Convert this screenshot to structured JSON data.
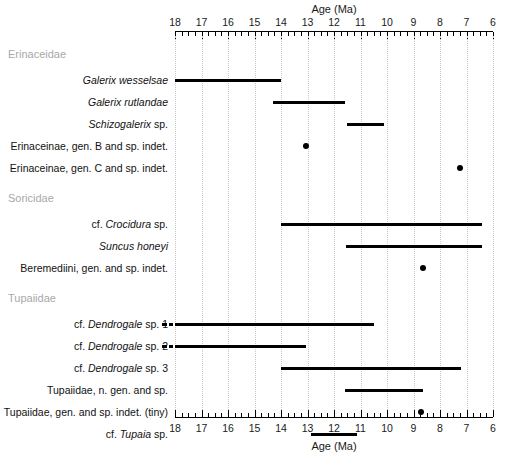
{
  "chart_data": {
    "type": "bar",
    "orientation": "horizontal",
    "title": "",
    "xlabel": "Age (Ma)",
    "ylabel": "",
    "xlim": [
      18,
      6
    ],
    "x_axis_reversed": true,
    "x_ticks": [
      18,
      17,
      16,
      15,
      14,
      13,
      12,
      11,
      10,
      9,
      8,
      7,
      6
    ],
    "x_minor_tick_interval": 0.25,
    "axes_shown": [
      "top",
      "bottom"
    ],
    "grid": "vertical dotted gridlines at every whole Ma",
    "legend": "none",
    "units": "Ma (millions of years ago)",
    "groups": [
      {
        "name": "Erinaceidae",
        "taxa": [
          {
            "label_parts": [
              {
                "text": "Galerix wesselsae",
                "style": "italic"
              }
            ],
            "label_plain": "Galerix wesselsae",
            "kind": "range",
            "start_ma": 18.0,
            "end_ma": 14.0,
            "dashed_extension": false
          },
          {
            "label_parts": [
              {
                "text": "Galerix rutlandae",
                "style": "italic"
              }
            ],
            "label_plain": "Galerix rutlandae",
            "kind": "range",
            "start_ma": 14.3,
            "end_ma": 11.6,
            "dashed_extension": false
          },
          {
            "label_parts": [
              {
                "text": "Schizogalerix",
                "style": "italic"
              },
              {
                "text": " sp.",
                "style": "normal"
              }
            ],
            "label_plain": "Schizogalerix sp.",
            "kind": "range",
            "start_ma": 11.5,
            "end_ma": 10.1,
            "dashed_extension": false
          },
          {
            "label_parts": [
              {
                "text": "Erinaceinae, gen. B and sp. indet.",
                "style": "normal"
              }
            ],
            "label_plain": "Erinaceinae, gen. B and sp. indet.",
            "kind": "point",
            "at_ma": 13.05,
            "dashed_extension": false
          },
          {
            "label_parts": [
              {
                "text": "Erinaceinae, gen. C and sp. indet.",
                "style": "normal"
              }
            ],
            "label_plain": "Erinaceinae, gen. C and sp. indet.",
            "kind": "point",
            "at_ma": 7.25,
            "dashed_extension": false
          }
        ]
      },
      {
        "name": "Soricidae",
        "taxa": [
          {
            "label_parts": [
              {
                "text": "cf. ",
                "style": "normal"
              },
              {
                "text": "Crocidura",
                "style": "italic"
              },
              {
                "text": " sp.",
                "style": "normal"
              }
            ],
            "label_plain": "cf. Crocidura sp.",
            "kind": "range",
            "start_ma": 14.0,
            "end_ma": 6.4,
            "dashed_extension": false
          },
          {
            "label_parts": [
              {
                "text": "Suncus honeyi",
                "style": "italic"
              }
            ],
            "label_plain": "Suncus honeyi",
            "kind": "range",
            "start_ma": 11.55,
            "end_ma": 6.4,
            "dashed_extension": false
          },
          {
            "label_parts": [
              {
                "text": "Beremediini, gen. and sp. indet.",
                "style": "normal"
              }
            ],
            "label_plain": "Beremediini, gen. and sp. indet.",
            "kind": "point",
            "at_ma": 8.65,
            "dashed_extension": false
          }
        ]
      },
      {
        "name": "Tupaiidae",
        "taxa": [
          {
            "label_parts": [
              {
                "text": "cf. ",
                "style": "normal"
              },
              {
                "text": "Dendrogale",
                "style": "italic"
              },
              {
                "text": " sp. 1",
                "style": "normal"
              }
            ],
            "label_plain": "cf. Dendrogale sp. 1",
            "kind": "range",
            "start_ma": 18.0,
            "end_ma": 10.5,
            "dashed_extension": true
          },
          {
            "label_parts": [
              {
                "text": "cf. ",
                "style": "normal"
              },
              {
                "text": "Dendrogale",
                "style": "italic"
              },
              {
                "text": " sp. 2",
                "style": "normal"
              }
            ],
            "label_plain": "cf. Dendrogale sp. 2",
            "kind": "range",
            "start_ma": 18.0,
            "end_ma": 13.05,
            "dashed_extension": true
          },
          {
            "label_parts": [
              {
                "text": "cf. ",
                "style": "normal"
              },
              {
                "text": "Dendrogale",
                "style": "italic"
              },
              {
                "text": " sp. 3",
                "style": "normal"
              }
            ],
            "label_plain": "cf. Dendrogale sp. 3",
            "kind": "range",
            "start_ma": 14.0,
            "end_ma": 7.2,
            "dashed_extension": false
          },
          {
            "label_parts": [
              {
                "text": "Tupaiidae, n. gen. and sp.",
                "style": "normal"
              }
            ],
            "label_plain": "Tupaiidae, n. gen. and sp.",
            "kind": "range",
            "start_ma": 11.6,
            "end_ma": 8.65,
            "dashed_extension": false
          },
          {
            "label_parts": [
              {
                "text": "Tupaiidae, gen. and sp. indet. (tiny)",
                "style": "normal"
              }
            ],
            "label_plain": "Tupaiidae, gen. and sp. indet. (tiny)",
            "kind": "point",
            "at_ma": 8.7,
            "dashed_extension": false
          },
          {
            "label_parts": [
              {
                "text": "cf. ",
                "style": "normal"
              },
              {
                "text": "Tupaia",
                "style": "italic"
              },
              {
                "text": " sp.",
                "style": "normal"
              }
            ],
            "label_plain": "cf. Tupaia sp.",
            "kind": "range",
            "start_ma": 12.85,
            "end_ma": 11.15,
            "dashed_extension": false
          }
        ]
      }
    ]
  },
  "colors": {
    "bar": "#000000",
    "point": "#000000",
    "grid": "#c8c8c8",
    "group_label": "#a8a8a8",
    "axis": "#000000",
    "background": "#ffffff"
  }
}
